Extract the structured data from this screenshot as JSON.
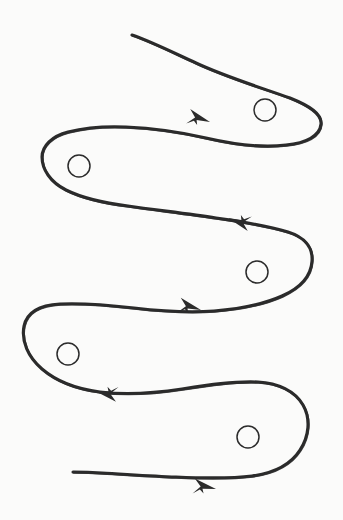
{
  "canvas": {
    "width": 343,
    "height": 520,
    "background_color": "#fbfbfa",
    "ink_color": "#2b2b2b",
    "stroke_width": 3.1,
    "circle_stroke_width": 1.5,
    "title": "Hand-drawn serpentine path with directional arrows and circular waypoints"
  },
  "diagram": {
    "type": "freehand-line-drawing",
    "stroke_start": {
      "x": 132,
      "y": 35,
      "label": "top-left open end"
    },
    "stroke_end": {
      "x": 73,
      "y": 472,
      "label": "bottom-left open end"
    },
    "pass_count": 5,
    "turn_count": 4,
    "path_d": "M 132 35 C 150 41 172 52 196 63 C 226 77 262 88 290 98 C 310 106 322 114 321 124 C 320 136 306 143 286 145 C 262 148 232 144 206 138 C 180 132 150 128 126 127 C 104 126 84 128 68 132 C 52 136 42 146 42 157 C 42 169 50 182 66 190 C 82 198 104 203 128 206 C 156 210 190 214 216 218 C 244 222 268 226 288 232 C 304 237 313 247 312 261 C 311 276 300 288 282 296 C 264 304 240 309 214 311 C 188 313 160 311 134 308 C 108 305 82 303 60 304 C 40 305 27 312 24 326 C 21 341 28 357 42 369 C 56 381 76 389 100 392 C 126 395 156 393 182 389 C 208 385 234 381 258 382 C 278 383 295 391 303 405 C 311 419 309 436 300 450 C 291 464 274 473 252 476 C 228 479 200 478 176 477 C 150 476 122 474 102 473 C 88 472 79 472 73 472",
    "arrows": [
      {
        "id": "arrow-1",
        "index": 1,
        "direction": "right",
        "tip_x": 210,
        "tip_y": 122,
        "angle_deg": 12,
        "pass": 1
      },
      {
        "id": "arrow-2",
        "index": 2,
        "direction": "left",
        "tip_x": 228,
        "tip_y": 218,
        "angle_deg": 192,
        "pass": 2
      },
      {
        "id": "arrow-3",
        "index": 3,
        "direction": "right",
        "tip_x": 201,
        "tip_y": 310,
        "angle_deg": 10,
        "pass": 3
      },
      {
        "id": "arrow-4",
        "index": 4,
        "direction": "left",
        "tip_x": 95,
        "tip_y": 391,
        "angle_deg": 186,
        "pass": 4
      },
      {
        "id": "arrow-5",
        "index": 5,
        "direction": "right",
        "tip_x": 216,
        "tip_y": 489,
        "angle_deg": 5,
        "pass": 5
      }
    ],
    "circles": [
      {
        "id": "circle-1",
        "index": 1,
        "cx": 265,
        "cy": 110,
        "r": 11,
        "lobe": "top-right"
      },
      {
        "id": "circle-2",
        "index": 2,
        "cx": 79,
        "cy": 166,
        "r": 11,
        "lobe": "upper-left"
      },
      {
        "id": "circle-3",
        "index": 3,
        "cx": 257,
        "cy": 272,
        "r": 11,
        "lobe": "middle-right"
      },
      {
        "id": "circle-4",
        "index": 4,
        "cx": 68,
        "cy": 354,
        "r": 11,
        "lobe": "lower-left"
      },
      {
        "id": "circle-5",
        "index": 5,
        "cx": 248,
        "cy": 437,
        "r": 11,
        "lobe": "bottom-right"
      }
    ]
  }
}
